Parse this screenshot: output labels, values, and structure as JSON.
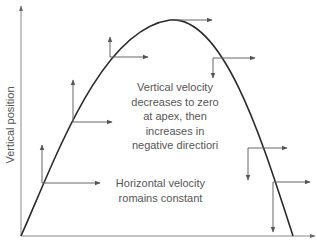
{
  "diagram": {
    "y_axis_label": "Vertical position",
    "x_axis_label": "",
    "annotations": {
      "vertical_velocity": {
        "lines": [
          "Vertical velocity",
          "decreases to zero",
          "at apex, then",
          "increases in",
          "negative directiori"
        ]
      },
      "horizontal_velocity": {
        "lines": [
          "Horizontal velocity",
          "romains constant"
        ]
      }
    },
    "colors": {
      "curve": "#2a2a2a",
      "axis": "#888888",
      "arrow": "#666666",
      "text": "#555555"
    },
    "velocity_points": [
      {
        "x": 42,
        "y": 183,
        "vx": 58,
        "vy": -38
      },
      {
        "x": 73,
        "y": 122,
        "vx": 39,
        "vy": -42
      },
      {
        "x": 110,
        "y": 57,
        "vx": 38,
        "vy": -20
      },
      {
        "x": 170,
        "y": 20,
        "vx": 42,
        "vy": 0
      },
      {
        "x": 213,
        "y": 58,
        "vx": 42,
        "vy": 20
      },
      {
        "x": 248,
        "y": 148,
        "vx": 39,
        "vy": 32
      },
      {
        "x": 273,
        "y": 182,
        "vx": 37,
        "vy": 50
      }
    ]
  }
}
